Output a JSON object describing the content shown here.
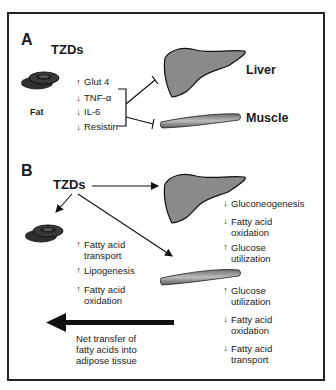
{
  "panel_a": {
    "label": "A",
    "drug": "TZDs",
    "fat_label": "Fat",
    "liver_label": "Liver",
    "muscle_label": "Muscle",
    "fat_markers": [
      {
        "direction": "up",
        "arrow": "↑",
        "text": "Glut 4"
      },
      {
        "direction": "down",
        "arrow": "↓",
        "text": "TNF-α"
      },
      {
        "direction": "down",
        "arrow": "↓",
        "text": "IL-6"
      },
      {
        "direction": "down",
        "arrow": "↓",
        "text": "Resistin"
      }
    ]
  },
  "panel_b": {
    "label": "B",
    "drug": "TZDs",
    "adipose_effects": [
      {
        "direction": "up",
        "arrow": "↑",
        "line1": "Fatty acid",
        "line2": "transport"
      },
      {
        "direction": "up",
        "arrow": "↑",
        "line1": "Lipogenesis",
        "line2": ""
      },
      {
        "direction": "up",
        "arrow": "↑",
        "line1": "Fatty acid",
        "line2": "oxidation"
      }
    ],
    "liver_effects": [
      {
        "direction": "down",
        "arrow": "↓",
        "line1": "Gluconeogenesis",
        "line2": ""
      },
      {
        "direction": "down",
        "arrow": "↓",
        "line1": "Fatty acid",
        "line2": "oxidation"
      },
      {
        "direction": "up",
        "arrow": "↑",
        "line1": "Glucose",
        "line2": "utilization"
      }
    ],
    "muscle_effects": [
      {
        "direction": "up",
        "arrow": "↑",
        "line1": "Glucose",
        "line2": "utilization"
      },
      {
        "direction": "down",
        "arrow": "↓",
        "line1": "Fatty acid",
        "line2": "oxidation"
      },
      {
        "direction": "down",
        "arrow": "↓",
        "line1": "Fatty acid",
        "line2": "transport"
      }
    ],
    "net_transfer": {
      "line1": "Net transfer of",
      "line2": "fatty acids into",
      "line3": "adipose tissue"
    }
  },
  "colors": {
    "organ_fill": "#8a8a8a",
    "fat_fill": "#3a3a3a",
    "stroke": "#1a1a1a"
  }
}
